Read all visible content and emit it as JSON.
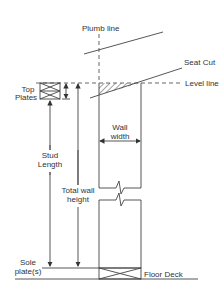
{
  "diagram": {
    "labels": {
      "plumb_line": "Plumb line",
      "seat_cut": "Seat Cut",
      "level_line": "Level line",
      "top_plates_1": "Top",
      "top_plates_2": "Plates",
      "wall_width_1": "Wall",
      "wall_width_2": "width",
      "stud_length_1": "Stud",
      "stud_length_2": "Length",
      "total_wall_height_1": "Total wall",
      "total_wall_height_2": "height",
      "sole_plates_1": "Sole",
      "sole_plates_2": "plate(s)",
      "floor_deck": "Floor Deck"
    },
    "colors": {
      "line": "#444444",
      "text": "#333333"
    }
  }
}
